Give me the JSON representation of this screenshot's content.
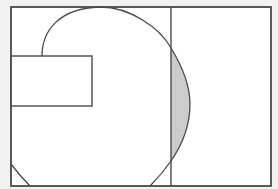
{
  "diagram": {
    "background": "#f2f2f2",
    "stroke_color": "#4a4a4a",
    "fill_white": "#ffffff",
    "shaded_fill": "#cccccc",
    "outer_rect": {
      "x": 11,
      "y": 7,
      "width": 260,
      "height": 179
    },
    "divider_line": {
      "x": 171,
      "y1": 7,
      "y2": 186
    },
    "inner_rect": {
      "x": 11,
      "y": 56,
      "width": 81,
      "height": 50
    },
    "shapes": [
      {
        "name": "outer-rectangle",
        "type": "rect"
      },
      {
        "name": "vertical-divider",
        "type": "line"
      },
      {
        "name": "small-rectangle",
        "type": "rect"
      },
      {
        "name": "large-curve",
        "type": "arc"
      },
      {
        "name": "shaded-lens-region",
        "type": "region"
      },
      {
        "name": "bottom-left-arc",
        "type": "arc"
      }
    ]
  }
}
